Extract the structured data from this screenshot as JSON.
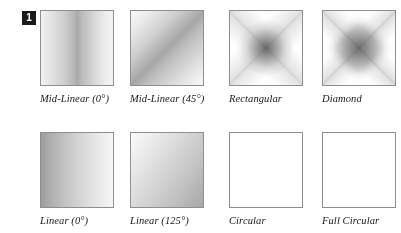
{
  "figure": {
    "badge_number": "1",
    "background_color": "#ffffff",
    "border_color": "#8e8e8e",
    "caption_color": "#16161a",
    "rows": [
      {
        "cells": [
          {
            "label": "Mid-Linear (0°)",
            "gradient": "mid-linear-0",
            "description": "white edges with dark vertical band through the middle"
          },
          {
            "label": "Mid-Linear (45°)",
            "gradient": "mid-linear-45",
            "description": "dark diagonal band running top-left to bottom-right"
          },
          {
            "label": "Rectangular",
            "gradient": "rectangular",
            "description": "dark center with star-shaped arms toward the corners"
          },
          {
            "label": "Diamond",
            "gradient": "diamond",
            "description": "rhombus dark at center fading to white corners"
          }
        ]
      },
      {
        "cells": [
          {
            "label": "Linear (0°)",
            "gradient": "linear-0",
            "description": "dark at the left edge fading light to the right"
          },
          {
            "label": "Linear (125°)",
            "gradient": "linear-125",
            "description": "light at top-left fading dark toward bottom-right"
          },
          {
            "label": "Circular",
            "gradient": "circular",
            "description": "round blob dark at center fading to white corners"
          },
          {
            "label": "Full Circular",
            "gradient": "full-circular",
            "description": "radial shade that still covers the corners in light grey"
          }
        ]
      }
    ]
  }
}
